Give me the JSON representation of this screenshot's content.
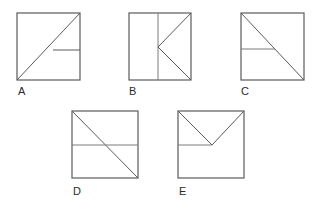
{
  "figure": {
    "background_color": "#ffffff",
    "stroke_color": "#5a5a5a",
    "label_color": "#2b2b2b",
    "stroke_width": 1.2,
    "square_size": 66,
    "count": 5
  },
  "items": [
    {
      "id": "A",
      "label": "A",
      "label_x": 18,
      "label_y": 95,
      "square": {
        "x": 17,
        "y": 13,
        "w": 63,
        "h": 67
      },
      "description": "Square with diagonal from bottom-left to top-right and a horizontal segment from the diagonal to the right edge at mid-height",
      "lines": [
        {
          "name": "diagonal-bottomleft-topright",
          "x1": 17,
          "y1": 80,
          "x2": 80,
          "y2": 13
        },
        {
          "name": "horizontal-right-segment",
          "x1": 53,
          "y1": 50,
          "x2": 80,
          "y2": 50
        }
      ]
    },
    {
      "id": "B",
      "label": "B",
      "label_x": 129,
      "label_y": 95,
      "square": {
        "x": 129,
        "y": 13,
        "w": 62,
        "h": 67
      },
      "description": "Square with a vertical line left of center and two diagonals from the top-right and bottom-right corners meeting at the vertical line's midpoint",
      "lines": [
        {
          "name": "vertical-divider",
          "x1": 158,
          "y1": 13,
          "x2": 158,
          "y2": 80
        },
        {
          "name": "diagonal-topright-to-center",
          "x1": 191,
          "y1": 13,
          "x2": 158,
          "y2": 47
        },
        {
          "name": "diagonal-bottomright-to-center",
          "x1": 191,
          "y1": 80,
          "x2": 158,
          "y2": 47
        }
      ]
    },
    {
      "id": "C",
      "label": "C",
      "label_x": 241,
      "label_y": 95,
      "square": {
        "x": 241,
        "y": 13,
        "w": 63,
        "h": 67
      },
      "description": "Square with diagonal from top-left to bottom-right and a horizontal segment from the left edge to the diagonal at mid-height",
      "lines": [
        {
          "name": "diagonal-topleft-bottomright",
          "x1": 241,
          "y1": 13,
          "x2": 304,
          "y2": 80
        },
        {
          "name": "horizontal-left-segment",
          "x1": 241,
          "y1": 49,
          "x2": 275,
          "y2": 49
        }
      ]
    },
    {
      "id": "D",
      "label": "D",
      "label_x": 73,
      "label_y": 195,
      "square": {
        "x": 72,
        "y": 111,
        "w": 66,
        "h": 67
      },
      "description": "Square with diagonal from top-left to bottom-right and a full-width horizontal line across the middle",
      "lines": [
        {
          "name": "diagonal-topleft-bottomright",
          "x1": 72,
          "y1": 111,
          "x2": 138,
          "y2": 178
        },
        {
          "name": "horizontal-full-width",
          "x1": 72,
          "y1": 145,
          "x2": 138,
          "y2": 145
        }
      ]
    },
    {
      "id": "E",
      "label": "E",
      "label_x": 179,
      "label_y": 195,
      "square": {
        "x": 178,
        "y": 111,
        "w": 66,
        "h": 67
      },
      "description": "Square with two diagonals from the top corners meeting at a central apex and a horizontal segment from the left edge to that apex",
      "lines": [
        {
          "name": "diagonal-topleft-to-apex",
          "x1": 178,
          "y1": 111,
          "x2": 212,
          "y2": 145
        },
        {
          "name": "diagonal-topright-to-apex",
          "x1": 244,
          "y1": 111,
          "x2": 212,
          "y2": 145
        },
        {
          "name": "horizontal-left-to-apex",
          "x1": 178,
          "y1": 145,
          "x2": 212,
          "y2": 145
        }
      ]
    }
  ]
}
